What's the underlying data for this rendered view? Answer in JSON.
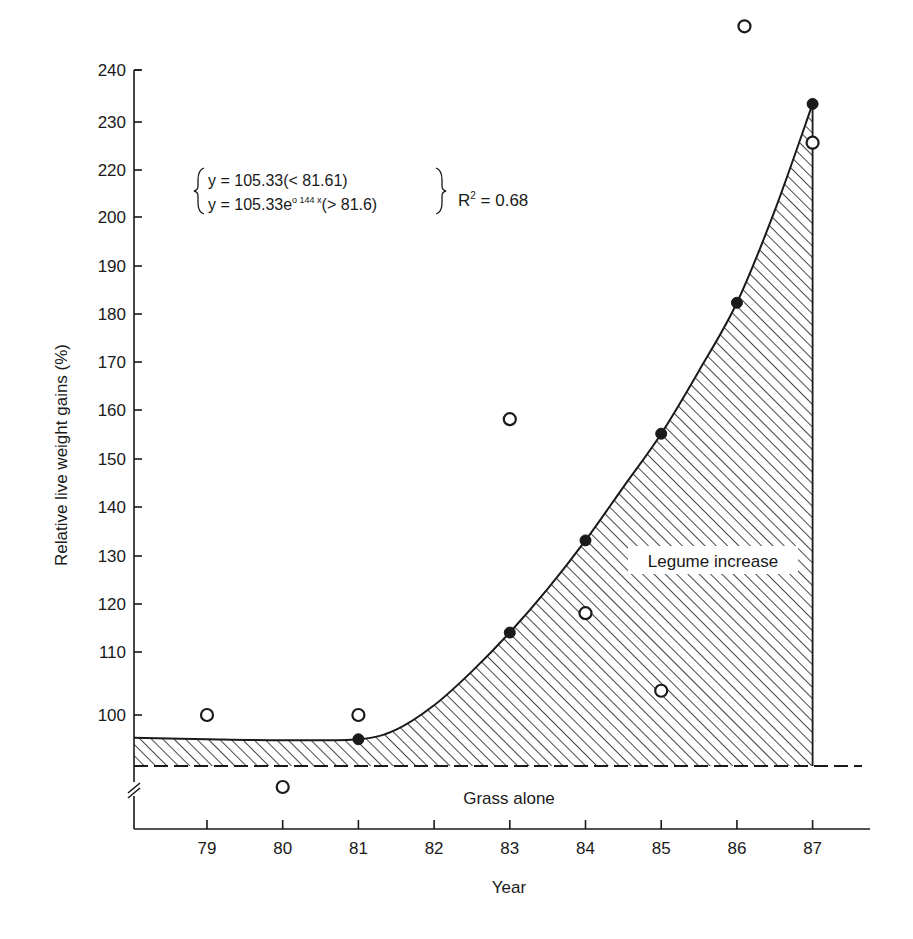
{
  "chart_data": {
    "type": "scatter",
    "title": "",
    "xlabel": "Year",
    "ylabel": "Relative live weight gains (%)",
    "xlim": [
      78,
      87.6
    ],
    "ylim_display": [
      92,
      240
    ],
    "x_tick_labels": [
      "79",
      "80",
      "81",
      "82",
      "83",
      "84",
      "85",
      "86",
      "87"
    ],
    "x_ticks": [
      79,
      80,
      81,
      82,
      83,
      84,
      85,
      86,
      87
    ],
    "y_tick_labels": [
      "240",
      "230",
      "220",
      "200",
      "190",
      "180",
      "170",
      "160",
      "150",
      "140",
      "130",
      "120",
      "110",
      "100"
    ],
    "y_tick_positions_px": [
      70,
      122,
      170,
      217,
      266,
      314,
      362,
      410,
      459,
      507,
      556,
      604,
      652,
      715
    ],
    "grid": false,
    "axis_break": true,
    "series": [
      {
        "name": "Fitted (filled points)",
        "marker": "filled-circle",
        "points": [
          {
            "x": 81,
            "y": 95
          },
          {
            "x": 83,
            "y": 117
          },
          {
            "x": 84,
            "y": 136
          },
          {
            "x": 85,
            "y": 158
          },
          {
            "x": 86,
            "y": 185
          },
          {
            "x": 87,
            "y": 226
          }
        ]
      },
      {
        "name": "Observed (open points)",
        "marker": "open-circle",
        "points": [
          {
            "x": 79,
            "y": 100
          },
          {
            "x": 80,
            "y": 88
          },
          {
            "x": 81,
            "y": 100
          },
          {
            "x": 83,
            "y": 161
          },
          {
            "x": 84,
            "y": 121
          },
          {
            "x": 85,
            "y": 105
          },
          {
            "x": 86,
            "y": 242
          },
          {
            "x": 87,
            "y": 218
          }
        ]
      }
    ],
    "fitted_curve": {
      "description": "Flat at ~95 until 81, then exponential rise to ~226 at 87",
      "points": [
        {
          "x": 78,
          "y": 95.3
        },
        {
          "x": 79,
          "y": 95
        },
        {
          "x": 80,
          "y": 94.8
        },
        {
          "x": 81,
          "y": 95
        },
        {
          "x": 81.5,
          "y": 97
        },
        {
          "x": 82,
          "y": 102
        },
        {
          "x": 82.5,
          "y": 109
        },
        {
          "x": 83,
          "y": 117
        },
        {
          "x": 83.5,
          "y": 126
        },
        {
          "x": 84,
          "y": 136
        },
        {
          "x": 84.5,
          "y": 147
        },
        {
          "x": 85,
          "y": 158
        },
        {
          "x": 85.5,
          "y": 171
        },
        {
          "x": 86,
          "y": 185
        },
        {
          "x": 86.5,
          "y": 204
        },
        {
          "x": 87,
          "y": 226
        }
      ]
    },
    "baseline": {
      "label": "Grass alone",
      "style": "dashed"
    },
    "shaded_region": {
      "label": "Legume increase",
      "pattern": "diagonal-hatch"
    },
    "annotations": {
      "eq_line1": "y = 105.33(< 81.61)",
      "eq_line2_prefix": "y = 105.33e",
      "eq_line2_exp": "o 144 x",
      "eq_line2_suffix": "(> 81.6)",
      "r2_prefix": "R",
      "r2_sup": "2",
      "r2_suffix": " = 0.68",
      "legume_label": "Legume increase",
      "grass_label": "Grass alone"
    }
  },
  "colors": {
    "ink": "#1a1a1a",
    "background": "#ffffff"
  }
}
